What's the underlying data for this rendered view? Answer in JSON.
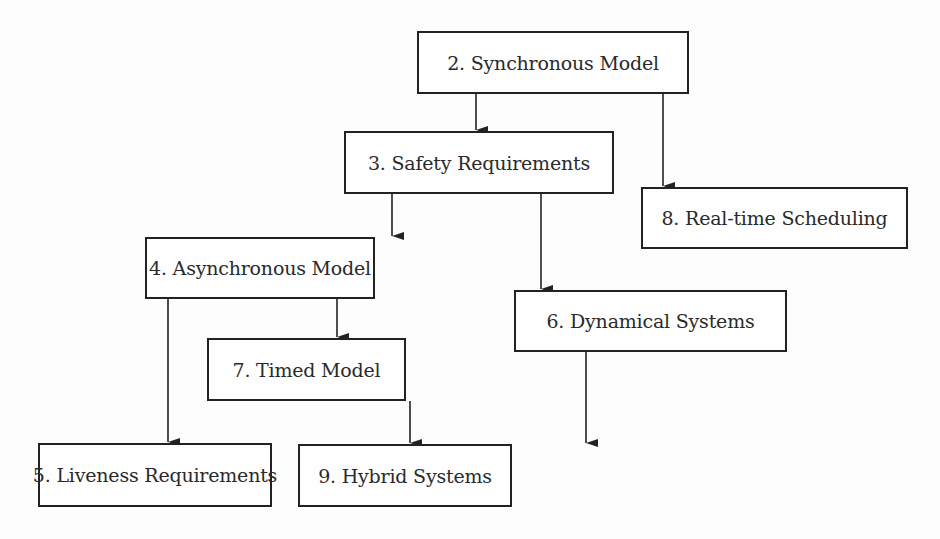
{
  "diagram": {
    "type": "dependency-flowchart",
    "nodes": [
      {
        "id": "n2",
        "label": "2. Synchronous Model",
        "x": 417,
        "y": 31,
        "w": 272,
        "h": 63
      },
      {
        "id": "n3",
        "label": "3. Safety Requirements",
        "x": 344,
        "y": 131,
        "w": 270,
        "h": 63
      },
      {
        "id": "n8",
        "label": "8. Real-time Scheduling",
        "x": 641,
        "y": 187,
        "w": 267,
        "h": 62
      },
      {
        "id": "n4",
        "label": "4. Asynchronous Model",
        "x": 145,
        "y": 237,
        "w": 230,
        "h": 62
      },
      {
        "id": "n6",
        "label": "6. Dynamical Systems",
        "x": 514,
        "y": 290,
        "w": 273,
        "h": 62
      },
      {
        "id": "n7",
        "label": "7. Timed Model",
        "x": 207,
        "y": 338,
        "w": 199,
        "h": 63
      },
      {
        "id": "n5",
        "label": "5. Liveness Requirements",
        "x": 38,
        "y": 443,
        "w": 234,
        "h": 64
      },
      {
        "id": "n9",
        "label": "9. Hybrid Systems",
        "x": 298,
        "y": 444,
        "w": 214,
        "h": 63
      }
    ],
    "edges": [
      {
        "from": "n2",
        "to": "n3",
        "x": 476,
        "y1": 94,
        "y2": 131
      },
      {
        "from": "n2",
        "to": "n8",
        "x": 663,
        "y1": 94,
        "y2": 187
      },
      {
        "from": "n3",
        "to": "n4",
        "x": 392,
        "y1": 194,
        "y2": 237
      },
      {
        "from": "n3",
        "to": "n6",
        "x": 541,
        "y1": 194,
        "y2": 290
      },
      {
        "from": "n4",
        "to": "n5",
        "x": 168,
        "y1": 299,
        "y2": 443
      },
      {
        "from": "n4",
        "to": "n7",
        "x": 337,
        "y1": 299,
        "y2": 338
      },
      {
        "from": "n7",
        "to": "n9",
        "x": 410,
        "y1": 401,
        "y2": 444
      },
      {
        "from": "n6",
        "to": "n9",
        "x": 586,
        "y1": 352,
        "y2": 444
      }
    ],
    "colors": {
      "line": "#222222",
      "text": "#2a2a2a",
      "background": "#fdfdfd"
    }
  }
}
